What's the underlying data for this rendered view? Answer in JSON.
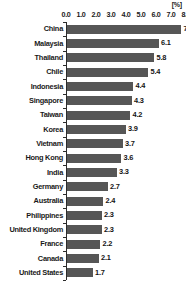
{
  "chart_data": {
    "type": "bar",
    "orientation": "horizontal",
    "title": "",
    "subtitle": "",
    "xlabel": "",
    "ylabel": "",
    "unit_label": "[%]",
    "xlim": [
      0.0,
      8.0
    ],
    "xtick_step": 1.0,
    "xticks": [
      "0.0",
      "1.0",
      "2.0",
      "3.0",
      "4.0",
      "5.0",
      "6.0",
      "7.0",
      "8.0"
    ],
    "grid": false,
    "legend": null,
    "bar_color": "#565656",
    "axis_color": "#2b2b2b",
    "text_color": "#1a1a1a",
    "background_color": "#ffffff",
    "categories": [
      "China",
      "Malaysia",
      "Thailand",
      "Chile",
      "Indonesia",
      "Singapore",
      "Taiwan",
      "Korea",
      "Vietnam",
      "Hong Kong",
      "India",
      "Germany",
      "Australia",
      "Philippines",
      "United Kingdom",
      "France",
      "Canada",
      "United States"
    ],
    "values": [
      7.6,
      6.1,
      5.8,
      5.4,
      4.4,
      4.3,
      4.2,
      3.9,
      3.7,
      3.6,
      3.3,
      2.7,
      2.4,
      2.3,
      2.3,
      2.2,
      2.1,
      1.7
    ],
    "value_labels": [
      "7.6",
      "6.1",
      "5.8",
      "5.4",
      "4.4",
      "4.3",
      "4.2",
      "3.9",
      "3.7",
      "3.6",
      "3.3",
      "2.7",
      "2.4",
      "2.3",
      "2.3",
      "2.2",
      "2.1",
      "1.7"
    ]
  }
}
